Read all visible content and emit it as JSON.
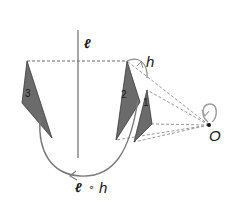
{
  "diagram": {
    "labels": {
      "line_label": "ℓ",
      "rotation_label": "h",
      "center_label": "O",
      "composition_label": "ℓ ∘ h",
      "composition_left": "ℓ",
      "composition_op": "∘",
      "composition_right": "h"
    },
    "triangles": [
      {
        "id": "1",
        "label": "1",
        "points": [
          [
            147,
            90
          ],
          [
            152,
            124
          ],
          [
            134,
            142
          ]
        ]
      },
      {
        "id": "2",
        "label": "2",
        "points": [
          [
            127,
            61
          ],
          [
            140,
            102
          ],
          [
            116,
            140
          ]
        ]
      },
      {
        "id": "3",
        "label": "3",
        "points": [
          [
            27,
            61
          ],
          [
            22,
            103
          ],
          [
            52,
            138
          ]
        ]
      }
    ],
    "colors": {
      "triangle_fill": "#6b6b6b",
      "triangle_stroke": "#3a3a3a",
      "line": "#8a8a8a",
      "dashed": "#8a8a8a",
      "arc": "#7a7a7a",
      "text": "#1a1a1a"
    }
  }
}
